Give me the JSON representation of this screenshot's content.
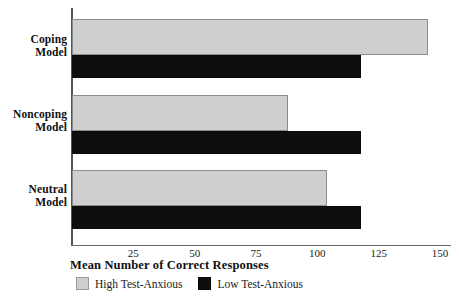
{
  "chart_data": {
    "type": "bar",
    "orientation": "horizontal",
    "title": "",
    "xlabel": "Mean Number of Correct Responses",
    "ylabel": "",
    "categories": [
      "Coping Model",
      "Noncoping Model",
      "Neutral Model"
    ],
    "series": [
      {
        "name": "High Test-Anxious",
        "color": "#cfcfcf",
        "values": [
          145,
          88,
          104
        ]
      },
      {
        "name": "Low Test-Anxious",
        "color": "#0e0e0e",
        "values": [
          118,
          118,
          118
        ]
      }
    ],
    "xlim": [
      0,
      150
    ],
    "xticks": [
      25,
      50,
      75,
      100,
      125,
      150
    ],
    "xtick_labels": [
      "25",
      "50",
      "75",
      "100",
      "125",
      "150"
    ],
    "grid": false,
    "legend_position": "bottom"
  },
  "categories": [
    {
      "line1": "Coping",
      "line2": "Model"
    },
    {
      "line1": "Noncoping",
      "line2": "Model"
    },
    {
      "line1": "Neutral",
      "line2": "Model"
    }
  ],
  "axis": {
    "title": "Mean Number of Correct Responses",
    "ticks": [
      "25",
      "50",
      "75",
      "100",
      "125",
      "150"
    ]
  },
  "legend": {
    "entries": [
      {
        "label": "High Test-Anxious",
        "swatch": "high-swatch-icon"
      },
      {
        "label": "Low Test-Anxious",
        "swatch": "low-swatch-icon"
      }
    ]
  }
}
